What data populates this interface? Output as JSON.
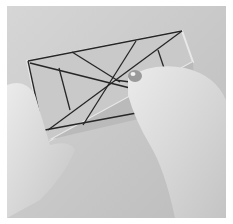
{
  "image": {
    "description": "Grayscale photo of two hands holding a rectangular box frame with dark string lines radiating from a central point; right hand holds a small metal bead",
    "colors": {
      "background": "#d0d0d0",
      "border": "#ffffff",
      "box": "#bdbdbd",
      "box_inner": "#c8c8c8",
      "string": "#262626",
      "skin": "#e2e2e2",
      "skin_shadow": "#b5b5b5"
    }
  }
}
